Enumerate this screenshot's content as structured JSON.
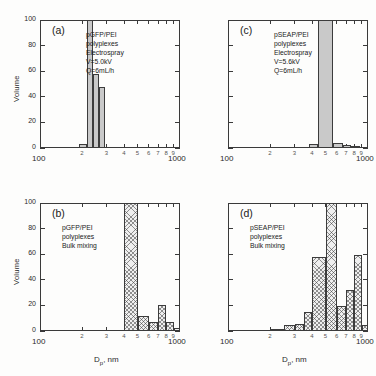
{
  "figure": {
    "title": "",
    "panels": [
      {
        "tag": "(a)",
        "annotation": [
          "pGFP/PEI",
          "polyplexes",
          "Electrospray",
          "V=5.0kV",
          "Q=6mL/h"
        ],
        "ylabel": "Volume",
        "xlabel_show": false,
        "xlabel": "",
        "x_start_label": "100",
        "x_end_label": "1000",
        "bar_style": "solid"
      },
      {
        "tag": "(b)",
        "annotation": [
          "pGFP/PEI",
          "polyplexes",
          "Bulk mixing"
        ],
        "ylabel": "Volume",
        "xlabel_show": true,
        "xlabel": "D",
        "xlabel_sub": "p",
        "xlabel_tail": ", nm",
        "x_start_label": "100",
        "x_end_label": "1000",
        "bar_style": "hatch"
      },
      {
        "tag": "(c)",
        "annotation": [
          "pSEAP/PEI",
          "polyplexes",
          "Electrospray",
          "V=5.6kV",
          "Q=6mL/h"
        ],
        "ylabel": "",
        "xlabel_show": false,
        "xlabel": "",
        "x_start_label": "100",
        "x_end_label": "1000",
        "bar_style": "solid"
      },
      {
        "tag": "(d)",
        "annotation": [
          "pSEAP/PEI",
          "polyplexes",
          "Bulk mixing"
        ],
        "ylabel": "",
        "xlabel_show": true,
        "xlabel": "D",
        "xlabel_sub": "p",
        "xlabel_tail": ", nm",
        "x_start_label": "100",
        "x_end_label": "1000",
        "bar_style": "hatch"
      }
    ]
  },
  "chart_data": [
    {
      "type": "bar",
      "panel": "a",
      "title": "pGFP/PEI polyplexes Electrospray V=5.0kV Q=6mL/h",
      "xlabel": "Dp, nm",
      "ylabel": "Volume",
      "xscale": "log",
      "xlim": [
        100,
        1000
      ],
      "ylim": [
        0,
        100
      ],
      "yticks": [
        0,
        20,
        40,
        60,
        80,
        100
      ],
      "xticks": [
        100,
        200,
        300,
        400,
        500,
        600,
        700,
        800,
        900,
        1000
      ],
      "xtick_labels": [
        "100",
        "2",
        "3",
        "4",
        "5",
        "6",
        "7",
        "8",
        "9",
        "1000"
      ],
      "grid": false,
      "bin_edges": [
        190,
        215,
        240,
        265,
        290
      ],
      "bin_centers": [
        202,
        227,
        252,
        277
      ],
      "values": [
        3,
        100,
        58,
        48
      ]
    },
    {
      "type": "bar",
      "panel": "b",
      "title": "pGFP/PEI polyplexes Bulk mixing",
      "xlabel": "Dp, nm",
      "ylabel": "Volume",
      "xscale": "log",
      "xlim": [
        100,
        1000
      ],
      "ylim": [
        0,
        100
      ],
      "yticks": [
        0,
        20,
        40,
        60,
        80,
        100
      ],
      "xticks": [
        100,
        200,
        300,
        400,
        500,
        600,
        700,
        800,
        900,
        1000
      ],
      "xtick_labels": [
        "100",
        "2",
        "3",
        "4",
        "5",
        "6",
        "7",
        "8",
        "9",
        "1000"
      ],
      "grid": false,
      "bin_edges": [
        400,
        500,
        600,
        700,
        800,
        900,
        1000
      ],
      "bin_centers": [
        450,
        550,
        650,
        750,
        850,
        950
      ],
      "values": [
        100,
        12,
        7,
        20,
        7,
        2
      ]
    },
    {
      "type": "bar",
      "panel": "c",
      "title": "pSEAP/PEI polyplexes Electrospray V=5.6kV Q=6mL/h",
      "xlabel": "Dp, nm",
      "ylabel": "Volume",
      "xscale": "log",
      "xlim": [
        100,
        1000
      ],
      "ylim": [
        0,
        100
      ],
      "yticks": [
        0,
        20,
        40,
        60,
        80,
        100
      ],
      "xticks": [
        100,
        200,
        300,
        400,
        500,
        600,
        700,
        800,
        900,
        1000
      ],
      "xtick_labels": [
        "100",
        "2",
        "3",
        "4",
        "5",
        "6",
        "7",
        "8",
        "9",
        "1000"
      ],
      "grid": false,
      "bin_edges": [
        380,
        440,
        560,
        660,
        760,
        880
      ],
      "bin_centers": [
        410,
        500,
        610,
        710,
        820
      ],
      "values": [
        3.5,
        100,
        4,
        2.5,
        1.5
      ]
    },
    {
      "type": "bar",
      "panel": "d",
      "title": "pSEAP/PEI polyplexes Bulk mixing",
      "xlabel": "Dp, nm",
      "ylabel": "Volume",
      "xscale": "log",
      "xlim": [
        100,
        1000
      ],
      "ylim": [
        0,
        100
      ],
      "yticks": [
        0,
        20,
        40,
        60,
        80,
        100
      ],
      "xticks": [
        100,
        200,
        300,
        400,
        500,
        600,
        700,
        800,
        900,
        1000
      ],
      "xtick_labels": [
        "100",
        "2",
        "3",
        "4",
        "5",
        "6",
        "7",
        "8",
        "9",
        "1000"
      ],
      "grid": false,
      "bin_edges": [
        200,
        250,
        300,
        350,
        400,
        500,
        600,
        700,
        800,
        900,
        1000
      ],
      "bin_centers": [
        225,
        275,
        325,
        375,
        450,
        550,
        650,
        750,
        850,
        950
      ],
      "values": [
        1,
        5,
        5.5,
        14.5,
        58,
        100,
        19.5,
        32,
        59,
        4.5
      ]
    }
  ],
  "axes": {
    "ytick_labels": [
      "0",
      "20",
      "40",
      "60",
      "80",
      "100"
    ],
    "xminor_labels": [
      "2",
      "3",
      "4",
      "5",
      "6",
      "7",
      "8",
      "9"
    ],
    "x_start": "100",
    "x_end": "1000",
    "volume_label": "Volume"
  },
  "colors": {
    "axis": "#3a3a3a",
    "bar_solid_fill": "#c9c9c9",
    "bar_hatch_fill": "#efefef",
    "bar_edge": "#3c3c3c",
    "text": "#1a1a1a",
    "background": "#fdfdfc"
  }
}
